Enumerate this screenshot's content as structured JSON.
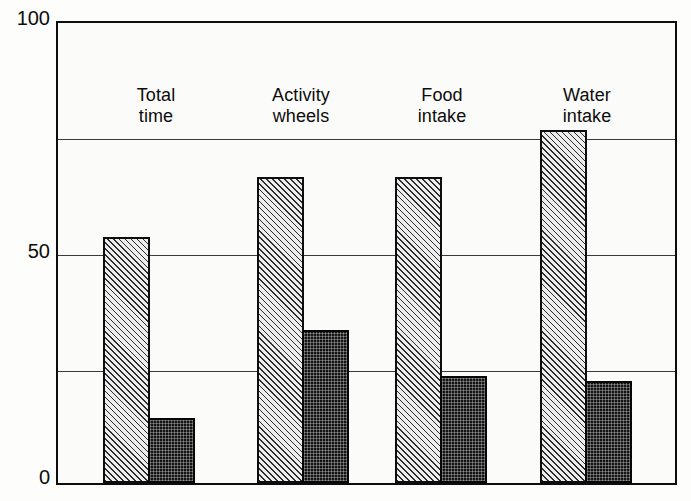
{
  "chart_data": {
    "type": "bar",
    "title": "",
    "subtitle": "",
    "xlabel": "",
    "ylabel": "",
    "ylim": [
      0,
      100
    ],
    "yticks": [
      0,
      50,
      100
    ],
    "ytick_labels": [
      "0",
      "50",
      "100"
    ],
    "gridlines": [
      25,
      50,
      75
    ],
    "grid": true,
    "legend": "none",
    "categories": [
      "Total\ntime",
      "Activity\nwheels",
      "Food\nintake",
      "Water\nintake"
    ],
    "series": [
      {
        "name": "series-a",
        "fill": "diagonal-hatch",
        "values": [
          53,
          66,
          66,
          76
        ]
      },
      {
        "name": "series-b",
        "fill": "dark-crosshatch",
        "values": [
          14,
          33,
          23,
          22
        ]
      }
    ]
  },
  "axis": {
    "y_top_label": "100",
    "y_mid_label": "50",
    "y_bottom_label": "0"
  },
  "categories": [
    {
      "label": "Total\ntime",
      "a": 53,
      "b": 14
    },
    {
      "label": "Activity\nwheels",
      "a": 66,
      "b": 33
    },
    {
      "label": "Food\nintake",
      "a": 66,
      "b": 23
    },
    {
      "label": "Water\nintake",
      "a": 76,
      "b": 22
    }
  ],
  "colors": {
    "frame": "#0d0d0d",
    "grid": "#3a3a3a",
    "series_a": "#ededed",
    "series_b": "#141414",
    "background": "#fdfdfc"
  }
}
